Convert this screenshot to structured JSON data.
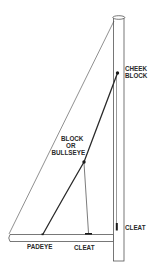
{
  "diagram": {
    "title": "",
    "colors": {
      "background": "#ffffff",
      "line": "#2a2a2a",
      "outline": "#555555"
    },
    "labels": {
      "cheek_block_line1": "CHEEK",
      "cheek_block_line2": "BLOCK",
      "block_line1": "BLOCK",
      "block_line2": "OR",
      "block_line3": "BULLSEYE",
      "padeye": "PADEYE",
      "boom_cleat": "CLEAT",
      "mast_cleat": "CLEAT"
    },
    "components": [
      {
        "id": "mast",
        "label": ""
      },
      {
        "id": "boom",
        "label": ""
      },
      {
        "id": "cheek-block",
        "label": "CHEEK BLOCK"
      },
      {
        "id": "bullseye-block",
        "label": "BLOCK OR BULLSEYE"
      },
      {
        "id": "padeye",
        "label": "PADEYE"
      },
      {
        "id": "boom-cleat",
        "label": "CLEAT"
      },
      {
        "id": "mast-cleat",
        "label": "CLEAT"
      }
    ]
  }
}
